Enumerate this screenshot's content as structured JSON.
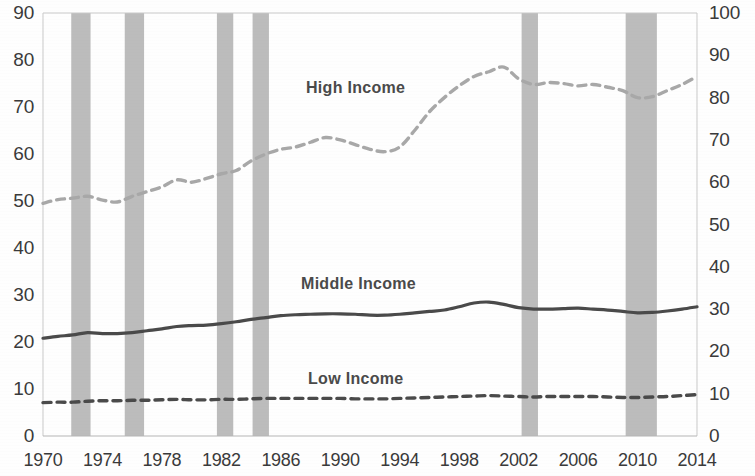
{
  "chart_data": {
    "type": "line",
    "title": "",
    "xlabel": "",
    "ylabel": "",
    "grid": false,
    "legend_position": "inline-annotations",
    "xlim": [
      1970,
      2014
    ],
    "x_ticks": [
      "1970",
      "1974",
      "1978",
      "1982",
      "1986",
      "1990",
      "1994",
      "1998",
      "2002",
      "2006",
      "2010",
      "2014"
    ],
    "left_axis": {
      "ylim": [
        0,
        90
      ],
      "ticks": [
        "0",
        "10",
        "20",
        "30",
        "40",
        "50",
        "60",
        "70",
        "80",
        "90"
      ],
      "tick_values": [
        0,
        10,
        20,
        30,
        40,
        50,
        60,
        70,
        80,
        90
      ]
    },
    "right_axis": {
      "ylim": [
        0,
        100
      ],
      "ticks": [
        "0",
        "10",
        "20",
        "30",
        "40",
        "50",
        "60",
        "70",
        "80",
        "90",
        "100"
      ],
      "tick_values": [
        0,
        10,
        20,
        30,
        40,
        50,
        60,
        70,
        80,
        90,
        100
      ]
    },
    "x": [
      1970,
      1971,
      1972,
      1973,
      1974,
      1975,
      1976,
      1977,
      1978,
      1979,
      1980,
      1981,
      1982,
      1983,
      1984,
      1985,
      1986,
      1987,
      1988,
      1989,
      1990,
      1991,
      1992,
      1993,
      1994,
      1995,
      1996,
      1997,
      1998,
      1999,
      2000,
      2001,
      2002,
      2003,
      2004,
      2005,
      2006,
      2007,
      2008,
      2009,
      2010,
      2011,
      2012,
      2013,
      2014
    ],
    "series": [
      {
        "name": "High Income",
        "style": "dashed",
        "color": "#a8a8a8",
        "axis": "left",
        "values": [
          49.5,
          50.3,
          50.6,
          51.0,
          50.2,
          49.8,
          51.0,
          52.0,
          53.0,
          54.5,
          54.0,
          54.8,
          55.8,
          56.5,
          58.5,
          60.0,
          61.0,
          61.5,
          62.5,
          63.5,
          63.0,
          62.0,
          61.0,
          60.5,
          61.5,
          65.0,
          69.0,
          72.0,
          74.5,
          76.5,
          77.5,
          78.5,
          76.0,
          74.8,
          75.2,
          75.0,
          74.5,
          74.8,
          74.2,
          73.5,
          72.0,
          72.2,
          73.5,
          74.8,
          76.5
        ]
      },
      {
        "name": "Middle Income",
        "style": "solid",
        "color": "#4a4a4a",
        "axis": "left",
        "values": [
          20.8,
          21.2,
          21.5,
          22.0,
          21.8,
          21.8,
          22.0,
          22.4,
          22.8,
          23.3,
          23.5,
          23.6,
          23.9,
          24.3,
          24.8,
          25.2,
          25.6,
          25.8,
          25.9,
          26.0,
          26.0,
          25.9,
          25.7,
          25.7,
          25.9,
          26.2,
          26.5,
          26.8,
          27.5,
          28.3,
          28.5,
          28.0,
          27.3,
          27.0,
          27.0,
          27.1,
          27.2,
          27.0,
          26.8,
          26.5,
          26.2,
          26.3,
          26.6,
          27.0,
          27.5
        ]
      },
      {
        "name": "Low Income",
        "style": "dashed",
        "color": "#4a4a4a",
        "axis": "left",
        "values": [
          7.1,
          7.2,
          7.2,
          7.4,
          7.5,
          7.5,
          7.6,
          7.6,
          7.7,
          7.8,
          7.7,
          7.7,
          7.8,
          7.8,
          7.9,
          8.0,
          8.0,
          8.0,
          8.0,
          8.0,
          8.0,
          7.9,
          7.9,
          7.9,
          8.0,
          8.1,
          8.2,
          8.3,
          8.4,
          8.5,
          8.6,
          8.5,
          8.4,
          8.3,
          8.4,
          8.4,
          8.4,
          8.4,
          8.3,
          8.2,
          8.2,
          8.3,
          8.4,
          8.6,
          8.8
        ]
      }
    ],
    "recession_bands": [
      {
        "start": 1971.9,
        "end": 1973.2
      },
      {
        "start": 1975.5,
        "end": 1976.8
      },
      {
        "start": 1981.7,
        "end": 1982.8
      },
      {
        "start": 1984.1,
        "end": 1985.2
      },
      {
        "start": 2002.2,
        "end": 2003.3
      },
      {
        "start": 2009.2,
        "end": 2011.3
      }
    ],
    "band_color": "#bcbcbc"
  },
  "annotations": {
    "high_income": "High Income",
    "middle_income": "Middle Income",
    "low_income": "Low Income"
  }
}
